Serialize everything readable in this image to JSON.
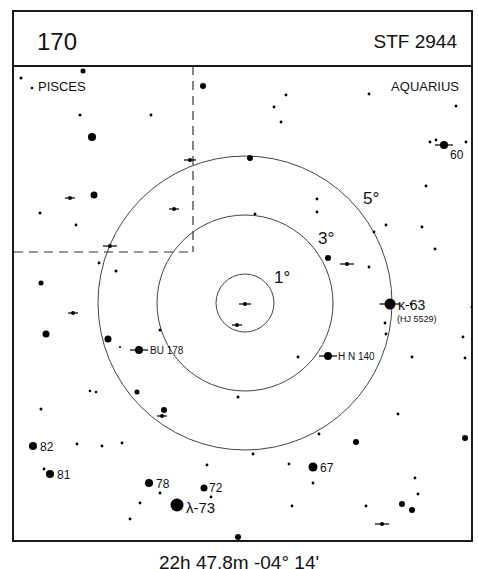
{
  "header": {
    "chart_number": "170",
    "star_designation": "STF 2944"
  },
  "constellations": [
    {
      "label": "PISCES",
      "x": 38,
      "y": 91
    },
    {
      "label": "AQUARIUS",
      "x": 459,
      "y": 91,
      "anchor": "end"
    }
  ],
  "footer": {
    "coordinates": "22h 47.8m  -04° 14'"
  },
  "rings": {
    "center": [
      245,
      303
    ],
    "items": [
      {
        "label": "1°",
        "r": 29,
        "lx": 274,
        "ly": 283
      },
      {
        "label": "3°",
        "r": 88,
        "lx": 318,
        "ly": 244
      },
      {
        "label": "5°",
        "r": 147,
        "lx": 363,
        "ly": 204
      }
    ]
  },
  "boundary": {
    "vx": 193,
    "vy1": 66,
    "vy2": 252,
    "hx1": 14,
    "hx2": 193,
    "hy": 252
  },
  "labeled_stars": [
    {
      "label": "60",
      "x": 444,
      "y": 145,
      "r": 4,
      "double": true,
      "lx": 450,
      "ly": 159,
      "size": 12
    },
    {
      "label": "κ-63",
      "x": 390,
      "y": 304,
      "r": 5.5,
      "double": true,
      "lx": 398,
      "ly": 310,
      "size": 14
    },
    {
      "label": "(HJ 5529)",
      "x": null,
      "y": null,
      "lx": 397,
      "ly": 322,
      "size": 9
    },
    {
      "label": "BU 178",
      "x": 139,
      "y": 350,
      "r": 4,
      "double": true,
      "lx": 150,
      "ly": 354,
      "size": 10
    },
    {
      "label": "H N 140",
      "x": 328,
      "y": 356,
      "r": 4,
      "double": true,
      "lx": 338,
      "ly": 360,
      "size": 10
    },
    {
      "label": "82",
      "x": 33,
      "y": 446,
      "r": 4,
      "lx": 40,
      "ly": 451,
      "size": 12
    },
    {
      "label": "81",
      "x": 50,
      "y": 474,
      "r": 4,
      "lx": 57,
      "ly": 479,
      "size": 12
    },
    {
      "label": "78",
      "x": 149,
      "y": 483,
      "r": 4,
      "lx": 156,
      "ly": 488,
      "size": 12
    },
    {
      "label": "72",
      "x": 204,
      "y": 488,
      "r": 3.5,
      "lx": 209,
      "ly": 492,
      "size": 12
    },
    {
      "label": "67",
      "x": 313,
      "y": 467,
      "r": 4.5,
      "lx": 320,
      "ly": 472,
      "size": 12
    },
    {
      "label": "λ-73",
      "x": 177,
      "y": 505,
      "r": 6.5,
      "lx": 186,
      "ly": 513,
      "size": 15
    }
  ],
  "stars": [
    [
      21,
      78,
      1.5
    ],
    [
      83,
      71,
      2.5
    ],
    [
      32,
      88,
      1.3
    ],
    [
      80,
      115,
      1.5
    ],
    [
      92,
      137,
      4
    ],
    [
      151,
      115,
      1.4
    ],
    [
      40,
      213,
      1.5
    ],
    [
      76,
      225,
      1.4
    ],
    [
      94,
      195,
      3.5
    ],
    [
      203,
      86,
      3
    ],
    [
      286,
      95,
      1.4
    ],
    [
      274,
      107,
      1.4
    ],
    [
      281,
      122,
      1.4
    ],
    [
      369,
      94,
      1.4
    ],
    [
      456,
      106,
      1.4
    ],
    [
      430,
      142,
      1.4
    ],
    [
      436,
      140,
      1.4
    ],
    [
      466,
      142,
      1.4
    ],
    [
      426,
      186,
      1.4
    ],
    [
      250,
      158,
      3
    ],
    [
      317,
      199,
      1.4
    ],
    [
      317,
      212,
      1.4
    ],
    [
      255,
      214,
      1.5
    ],
    [
      386,
      225,
      1.4
    ],
    [
      422,
      227,
      1.4
    ],
    [
      435,
      249,
      1.4
    ],
    [
      374,
      232,
      1.4
    ],
    [
      328,
      258,
      3
    ],
    [
      369,
      267,
      1.4
    ],
    [
      41,
      283,
      2.5
    ],
    [
      116,
      271,
      1.5
    ],
    [
      99,
      263,
      1.4
    ],
    [
      46,
      334,
      3.5
    ],
    [
      108,
      339,
      3.5
    ],
    [
      160,
      330,
      1.5
    ],
    [
      120,
      347,
      1
    ],
    [
      90,
      391,
      1.3
    ],
    [
      96,
      392,
      1.3
    ],
    [
      137,
      392,
      2.5
    ],
    [
      164,
      410,
      3
    ],
    [
      41,
      409,
      1.5
    ],
    [
      238,
      397,
      1.5
    ],
    [
      411,
      304,
      1.4
    ],
    [
      385,
      323,
      1.4
    ],
    [
      386,
      334,
      1.4
    ],
    [
      472,
      307,
      1.5
    ],
    [
      463,
      337,
      1.4
    ],
    [
      412,
      357,
      1.4
    ],
    [
      465,
      358,
      1.4
    ],
    [
      298,
      357,
      1.4
    ],
    [
      398,
      414,
      1.4
    ],
    [
      356,
      442,
      3
    ],
    [
      465,
      438,
      3
    ],
    [
      319,
      434,
      1.4
    ],
    [
      253,
      454,
      1.4
    ],
    [
      289,
      464,
      1.4
    ],
    [
      313,
      483,
      1.4
    ],
    [
      77,
      444,
      1.4
    ],
    [
      102,
      446,
      1.4
    ],
    [
      122,
      443,
      1.4
    ],
    [
      44,
      469,
      1.4
    ],
    [
      207,
      465,
      1.4
    ],
    [
      160,
      493,
      1.4
    ],
    [
      211,
      497,
      1.4
    ],
    [
      140,
      503,
      1.4
    ],
    [
      130,
      519,
      1.4
    ],
    [
      292,
      506,
      1.4
    ],
    [
      366,
      506,
      1.4
    ],
    [
      415,
      478,
      1.4
    ],
    [
      418,
      494,
      1.4
    ],
    [
      402,
      504,
      3
    ],
    [
      412,
      510,
      3
    ],
    [
      238,
      537,
      3
    ]
  ],
  "double_marks": [
    [
      190,
      160,
      6
    ],
    [
      70,
      198,
      5
    ],
    [
      174,
      209,
      5
    ],
    [
      110,
      246,
      7
    ],
    [
      73,
      313,
      5
    ],
    [
      162,
      416,
      5
    ],
    [
      245,
      304,
      6
    ],
    [
      237,
      325,
      5
    ],
    [
      347,
      264,
      7
    ],
    [
      382,
      524,
      7
    ]
  ]
}
